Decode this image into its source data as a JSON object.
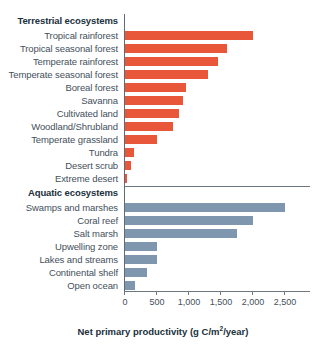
{
  "chart_data": {
    "type": "bar",
    "orientation": "horizontal",
    "title": "",
    "xlabel": "Net primary productivity (g C/m2/year)",
    "ylabel": "",
    "xlim": [
      0,
      2900
    ],
    "grid": false,
    "legend": "none",
    "xticks": [
      0,
      500,
      1000,
      1500,
      2000,
      2500
    ],
    "xticklabels": [
      "0",
      "500",
      "1,000",
      "1,500",
      "2,000",
      "2,500"
    ],
    "panels": [
      {
        "name": "terrestrial",
        "title": "Terrestrial ecosystems",
        "color": "#e8573a",
        "categories": [
          "Tropical rainforest",
          "Tropical seasonal forest",
          "Temperate rainforest",
          "Temperate seasonal forest",
          "Boreal forest",
          "Savanna",
          "Cultivated land",
          "Woodland/Shrubland",
          "Temperate grassland",
          "Tundra",
          "Desert scrub",
          "Extreme desert"
        ],
        "values": [
          2000,
          1600,
          1450,
          1300,
          950,
          900,
          850,
          750,
          500,
          140,
          90,
          30
        ]
      },
      {
        "name": "aquatic",
        "title": "Aquatic ecosystems",
        "color": "#7f97ae",
        "categories": [
          "Swamps and marshes",
          "Coral reef",
          "Salt marsh",
          "Upwelling zone",
          "Lakes and streams",
          "Continental shelf",
          "Open ocean"
        ],
        "values": [
          2500,
          2000,
          1750,
          500,
          500,
          350,
          150
        ]
      }
    ]
  },
  "axis_title": {
    "prefix": "Net primary productivity (g C/m",
    "exponent": "2",
    "suffix": "/year)"
  }
}
